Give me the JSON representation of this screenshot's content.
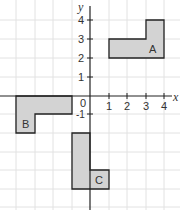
{
  "axes": {
    "x_label": "x",
    "y_label": "y",
    "origin_label": "0",
    "x_ticks": [
      "1",
      "2",
      "3",
      "4"
    ],
    "y_ticks": [
      "1",
      "2",
      "3",
      "4"
    ],
    "neg_y_tick": "-1"
  },
  "shapes": [
    {
      "label": "A",
      "vertices": [
        [
          1,
          2
        ],
        [
          4,
          2
        ],
        [
          4,
          4
        ],
        [
          3,
          4
        ],
        [
          3,
          3
        ],
        [
          1,
          3
        ]
      ]
    },
    {
      "label": "B",
      "vertices": [
        [
          -4,
          0
        ],
        [
          -1,
          0
        ],
        [
          -1,
          -1
        ],
        [
          -3,
          -1
        ],
        [
          -3,
          -2
        ],
        [
          -4,
          -2
        ]
      ]
    },
    {
      "label": "C",
      "vertices": [
        [
          -1,
          -2
        ],
        [
          0,
          -2
        ],
        [
          0,
          -4
        ],
        [
          1,
          -4
        ],
        [
          1,
          -5
        ],
        [
          -1,
          -5
        ]
      ]
    }
  ],
  "colors": {
    "shape_fill": "#d3d3d3",
    "shape_stroke": "#222222",
    "grid": "#e2e2e2"
  }
}
